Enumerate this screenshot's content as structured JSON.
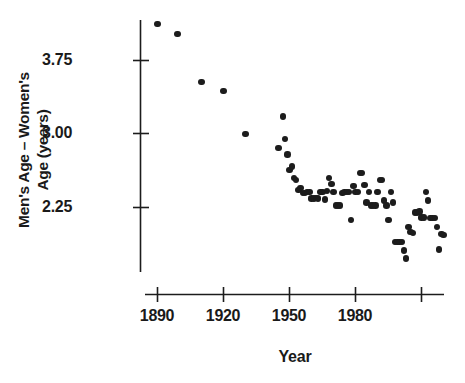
{
  "chart_data": {
    "type": "scatter",
    "title": "",
    "xlabel": "Year",
    "ylabel": "Men's Age – Women's Age (years)",
    "ylabel_lines": [
      "Men's Age – Women's",
      "Age (years)"
    ],
    "xlim": [
      1886,
      2008
    ],
    "ylim": [
      1.62,
      4.25
    ],
    "xticks": [
      1890,
      1920,
      1950,
      1980,
      2010
    ],
    "xtick_labels": [
      "1890",
      "1920",
      "1950",
      "1980",
      ""
    ],
    "yticks": [
      2.25,
      3.0,
      3.75
    ],
    "ytick_labels": [
      "2.25",
      "3.00",
      "3.75"
    ],
    "grid": false,
    "legend": null,
    "marker_color": "#1c1c1c",
    "marker_size_px": 6.4,
    "points": [
      [
        1890,
        4.12
      ],
      [
        1899,
        4.02
      ],
      [
        1910,
        3.53
      ],
      [
        1920,
        3.44
      ],
      [
        1930,
        3.0
      ],
      [
        1945,
        2.86
      ],
      [
        1947,
        3.18
      ],
      [
        1948,
        2.95
      ],
      [
        1949,
        2.79
      ],
      [
        1950,
        2.63
      ],
      [
        1951,
        2.67
      ],
      [
        1952,
        2.55
      ],
      [
        1953,
        2.53
      ],
      [
        1954,
        2.43
      ],
      [
        1955,
        2.45
      ],
      [
        1956,
        2.4
      ],
      [
        1957,
        2.4
      ],
      [
        1958,
        2.41
      ],
      [
        1959,
        2.41
      ],
      [
        1960,
        2.34
      ],
      [
        1961,
        2.34
      ],
      [
        1962,
        2.35
      ],
      [
        1963,
        2.34
      ],
      [
        1964,
        2.41
      ],
      [
        1965,
        2.41
      ],
      [
        1966,
        2.33
      ],
      [
        1967,
        2.42
      ],
      [
        1968,
        2.55
      ],
      [
        1969,
        2.49
      ],
      [
        1970,
        2.41
      ],
      [
        1971,
        2.27
      ],
      [
        1972,
        2.27
      ],
      [
        1973,
        2.27
      ],
      [
        1974,
        2.4
      ],
      [
        1975,
        2.41
      ],
      [
        1976,
        2.41
      ],
      [
        1977,
        2.41
      ],
      [
        1978,
        2.12
      ],
      [
        1979,
        2.47
      ],
      [
        1980,
        2.41
      ],
      [
        1981,
        2.41
      ],
      [
        1982,
        2.6
      ],
      [
        1983,
        2.6
      ],
      [
        1984,
        2.48
      ],
      [
        1985,
        2.3
      ],
      [
        1986,
        2.41
      ],
      [
        1987,
        2.27
      ],
      [
        1988,
        2.27
      ],
      [
        1989,
        2.27
      ],
      [
        1990,
        2.41
      ],
      [
        1991,
        2.53
      ],
      [
        1992,
        2.53
      ],
      [
        1993,
        2.32
      ],
      [
        1994,
        2.27
      ],
      [
        1995,
        2.12
      ],
      [
        1996,
        2.41
      ],
      [
        1997,
        2.3
      ],
      [
        1998,
        1.9
      ],
      [
        1999,
        1.9
      ],
      [
        2000,
        1.9
      ],
      [
        2001,
        1.9
      ],
      [
        2002,
        1.81
      ],
      [
        2003,
        1.73
      ],
      [
        2004,
        2.05
      ],
      [
        2005,
        2.0
      ],
      [
        2006,
        1.99
      ],
      [
        2007,
        2.2
      ],
      [
        2008,
        2.2
      ],
      [
        2009,
        2.21
      ],
      [
        2010,
        2.15
      ],
      [
        2011,
        2.15
      ],
      [
        2012,
        2.41
      ],
      [
        2013,
        2.32
      ],
      [
        2014,
        2.14
      ],
      [
        2015,
        2.14
      ],
      [
        2016,
        2.14
      ],
      [
        2017,
        2.05
      ],
      [
        2018,
        1.82
      ],
      [
        2019,
        1.98
      ],
      [
        2020,
        1.97
      ]
    ]
  },
  "axis": {
    "x_title": "Year",
    "y_title_line1": "Men's Age – Women's",
    "y_title_line2": "Age (years)",
    "x_tick_1": "1890",
    "x_tick_2": "1920",
    "x_tick_3": "1950",
    "x_tick_4": "1980",
    "y_tick_1": "3.75",
    "y_tick_2": "3.00",
    "y_tick_3": "2.25"
  }
}
